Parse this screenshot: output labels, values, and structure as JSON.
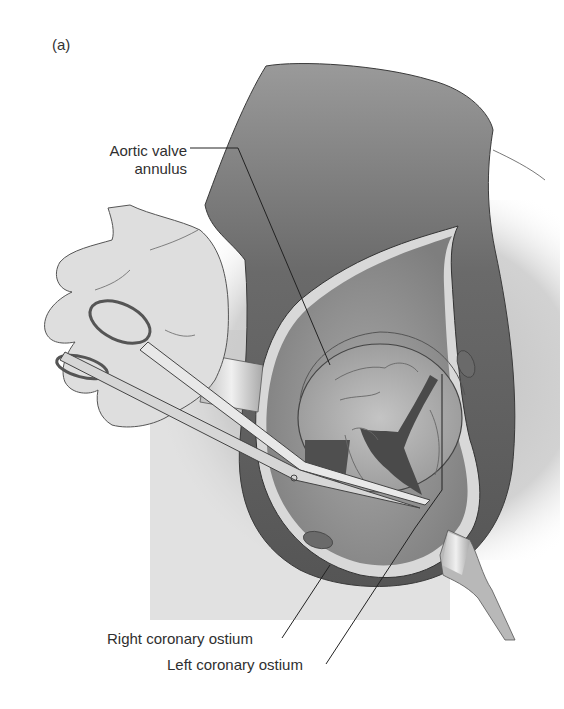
{
  "figure": {
    "panel_label": "(a)",
    "labels": {
      "aortic_valve_annulus_line1": "Aortic valve",
      "aortic_valve_annulus_line2": "annulus",
      "right_coronary_ostium": "Right coronary ostium",
      "left_coronary_ostium": "Left coronary ostium"
    },
    "colors": {
      "background": "#ffffff",
      "aorta_wall_dark": "#5e5e5e",
      "aorta_interior": "#8a8a8a",
      "incision_edge": "#d6d6d6",
      "glove": "#dcdcdc",
      "outline": "#3a3a3a",
      "leader_line": "#222222"
    }
  }
}
